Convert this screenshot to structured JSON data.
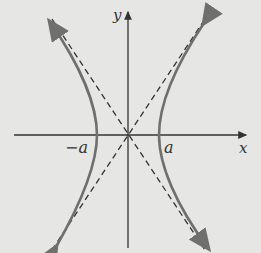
{
  "figure": {
    "type": "hyperbola",
    "labels": {
      "x_axis": "x",
      "y_axis": "y",
      "left_vertex": "−a",
      "right_vertex": "a"
    },
    "colors": {
      "background": "#e6e6e4",
      "curve": "#6f6f6f",
      "axes": "#333333",
      "asymptotes": "#333333"
    }
  }
}
